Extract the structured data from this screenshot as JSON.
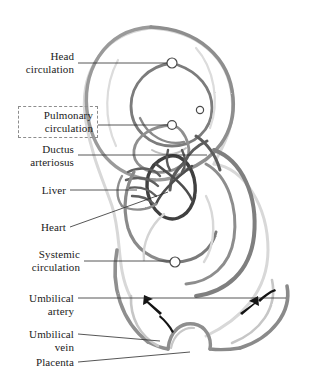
{
  "figure": {
    "style": "pencil sketch",
    "colors": {
      "ink": "#1b1b1b",
      "leader_line": "#2b2b2b",
      "pencil_dark": "#4a4a4a",
      "pencil_mid": "#8a8a8a",
      "pencil_light": "#c3c3c3",
      "pencil_faint": "#dedede",
      "dashed_box": "#8d8d8d",
      "background": "#ffffff"
    }
  },
  "labels": [
    {
      "id": "head-circulation",
      "text": "Head\ncirculation",
      "boxed": false
    },
    {
      "id": "pulmonary-circulation",
      "text": "Pulmonary\ncirculation",
      "boxed": true
    },
    {
      "id": "ductus-arteriosus",
      "text": "Ductus\narteriosus",
      "boxed": false
    },
    {
      "id": "liver",
      "text": "Liver",
      "boxed": false
    },
    {
      "id": "heart",
      "text": "Heart",
      "boxed": false
    },
    {
      "id": "systemic-circulation",
      "text": "Systemic\ncirculation",
      "boxed": false
    },
    {
      "id": "umbilical-artery",
      "text": "Umbilical\nartery",
      "boxed": false
    },
    {
      "id": "umbilical-vein",
      "text": "Umbilical\nvein",
      "boxed": false
    },
    {
      "id": "placenta",
      "text": "Placenta",
      "boxed": false
    }
  ],
  "structures": [
    {
      "id": "fetus-outline",
      "name": "fetus body outline"
    },
    {
      "id": "head-loop",
      "name": "head circulation loop"
    },
    {
      "id": "pulmonary-loop",
      "name": "pulmonary circulation loop"
    },
    {
      "id": "heart-loop",
      "name": "heart"
    },
    {
      "id": "liver-mass",
      "name": "liver"
    },
    {
      "id": "ductus-vessel",
      "name": "ductus arteriosus"
    },
    {
      "id": "systemic-loop",
      "name": "systemic circulation loop"
    },
    {
      "id": "umbilical-cord",
      "name": "umbilical artery and vein"
    },
    {
      "id": "placenta-bump",
      "name": "placenta"
    }
  ],
  "flow_arrows": [
    {
      "id": "flow-arrow-left",
      "direction": "up-left",
      "meaning": "blood flow toward fetus"
    },
    {
      "id": "flow-arrow-right",
      "direction": "down-left",
      "meaning": "blood flow toward placenta"
    }
  ],
  "vessel_markers": [
    {
      "id": "marker-head",
      "cx": 172,
      "cy": 63
    },
    {
      "id": "marker-head-2",
      "cx": 200,
      "cy": 110
    },
    {
      "id": "marker-pulmonary",
      "cx": 172,
      "cy": 125
    },
    {
      "id": "marker-systemic",
      "cx": 175,
      "cy": 262
    }
  ]
}
